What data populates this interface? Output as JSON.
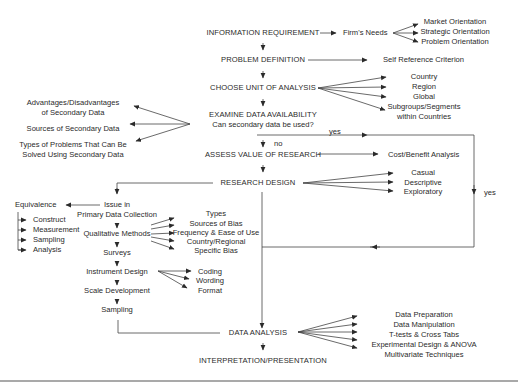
{
  "diagram": {
    "main_steps": [
      "INFORMATION REQUIREMENT",
      "PROBLEM DEFINITION",
      "CHOOSE UNIT OF ANALYSIS",
      "EXAMINE DATA AVAILABILITY",
      "ASSESS VALUE OF RESEARCH",
      "RESEARCH DESIGN",
      "DATA ANALYSIS",
      "INTERPRETATION/PRESENTATION"
    ],
    "examine_question": "Can secondary data be used?",
    "firms_needs": {
      "label": "Firm's Needs",
      "items": [
        "Market Orientation",
        "Strategic Orientation",
        "Problem Orientation"
      ]
    },
    "self_reference": "Self Reference Criterion",
    "unit_of_analysis": [
      "Country",
      "Region",
      "Global",
      "Subgroups/Segments",
      "within Countries"
    ],
    "secondary_data": [
      [
        "Advantages/Disadvantages",
        "of Secondary Data"
      ],
      [
        "Sources of Secondary Data"
      ],
      [
        "Types of Problems That Can Be",
        "Solved Using Secondary Data"
      ]
    ],
    "yes_label": "yes",
    "no_label": "no",
    "yes_label_right": "yes",
    "cost_benefit": "Cost/Benefit Analysis",
    "research_types": [
      "Casual",
      "Descriptive",
      "Exploratory"
    ],
    "primary": {
      "issue_line1": "Issue in",
      "issue_line2": "Primary Data Collection",
      "equivalence": "Equivalence",
      "equivalence_items": [
        "Construct",
        "Measurement",
        "Sampling",
        "Analysis"
      ],
      "qualitative": "Qualitative Methods",
      "qualitative_items": [
        "Types",
        "Sources of Bias",
        "Frequency & Ease of Use",
        "Country/Regional",
        "Specific Bias"
      ],
      "surveys": "Surveys",
      "instrument": "Instrument Design",
      "instrument_items": [
        "Coding",
        "Wording",
        "Format"
      ],
      "scale": "Scale Development",
      "sampling": "Sampling"
    },
    "analysis_items": [
      "Data Preparation",
      "Data Manipulation",
      "T-tests & Cross Tabs",
      "Experimental Design & ANOVA",
      "Multivariate Techniques"
    ]
  }
}
